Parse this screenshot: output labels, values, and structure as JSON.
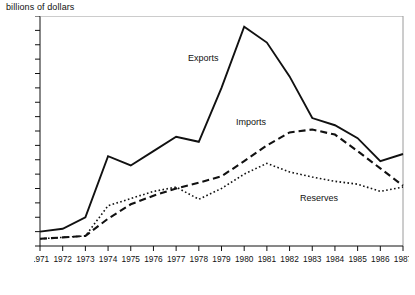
{
  "chart_data": {
    "type": "line",
    "title": "",
    "ylabel": "billions of dollars",
    "xlabel": "",
    "ylim": [
      0,
      320
    ],
    "ytick_step": 20,
    "yticks": [
      0,
      20,
      40,
      60,
      80,
      100,
      120,
      140,
      160,
      180,
      200,
      220,
      240,
      260,
      280,
      300,
      320
    ],
    "grid": false,
    "legend_position": "inline-annotations",
    "x": [
      1971,
      1972,
      1973,
      1974,
      1975,
      1976,
      1977,
      1978,
      1979,
      1980,
      1981,
      1982,
      1983,
      1984,
      1985,
      1986,
      1987
    ],
    "categories": [
      "1971",
      "1972",
      "1973",
      "1974",
      "1975",
      "1976",
      "1977",
      "1978",
      "1979",
      "1980",
      "1981",
      "1982",
      "1983",
      "1984",
      "1985",
      "1986",
      "1987"
    ],
    "series": [
      {
        "name": "Exports",
        "style": "solid",
        "color": "#111111",
        "values": [
          20,
          24,
          40,
          125,
          112,
          132,
          152,
          145,
          220,
          305,
          283,
          236,
          178,
          168,
          150,
          118,
          128
        ]
      },
      {
        "name": "Imports",
        "style": "dashed",
        "color": "#111111",
        "values": [
          10,
          12,
          14,
          38,
          58,
          70,
          80,
          88,
          97,
          118,
          140,
          158,
          162,
          155,
          132,
          108,
          84
        ]
      },
      {
        "name": "Reserves",
        "style": "dotted",
        "color": "#111111",
        "values": [
          10,
          12,
          14,
          56,
          66,
          76,
          82,
          65,
          80,
          100,
          115,
          103,
          96,
          90,
          86,
          76,
          82
        ]
      }
    ],
    "annotations": [
      {
        "text": "Exports",
        "x": 1978.2,
        "y": 258
      },
      {
        "text": "Imports",
        "x": 1980.3,
        "y": 168
      },
      {
        "text": "Reserves",
        "x": 1983.3,
        "y": 62
      }
    ]
  }
}
